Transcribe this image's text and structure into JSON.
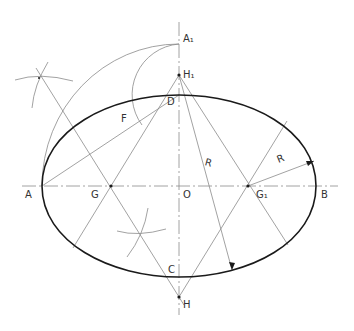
{
  "diagram": {
    "colors": {
      "thin": "#8a8a8a",
      "thick": "#1a1a1a",
      "label": "#333333"
    },
    "points": {
      "A": {
        "label": "A",
        "x": 42,
        "y": 186
      },
      "B": {
        "label": "B",
        "x": 316,
        "y": 186
      },
      "O": {
        "label": "O",
        "x": 179,
        "y": 186
      },
      "C": {
        "label": "C",
        "x": 179,
        "y": 277
      },
      "D": {
        "label": "D",
        "x": 179,
        "y": 95
      },
      "A1": {
        "label": "A₁",
        "x": 179,
        "y": 44
      },
      "H1": {
        "label": "H₁",
        "x": 179,
        "y": 75
      },
      "H": {
        "label": "H",
        "x": 179,
        "y": 297
      },
      "G": {
        "label": "G",
        "x": 111,
        "y": 186
      },
      "G1": {
        "label": "G₁",
        "x": 248,
        "y": 186
      },
      "F": {
        "label": "F",
        "x": 124,
        "y": 120
      }
    },
    "radius_labels": [
      {
        "label": "R",
        "x": 208,
        "y": 165
      },
      {
        "label": "R",
        "x": 280,
        "y": 160
      }
    ]
  }
}
